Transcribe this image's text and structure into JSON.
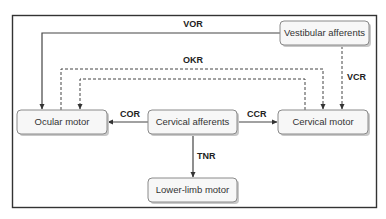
{
  "nodes": {
    "vestibular_afferents": "Vestibular afferents",
    "ocular_motor": "Ocular motor",
    "cervical_afferents": "Cervical afferents",
    "cervical_motor": "Cervical motor",
    "lower_limb_motor": "Lower-limb motor"
  },
  "edges": {
    "vor": {
      "label": "VOR",
      "from": "Vestibular afferents",
      "to": "Ocular motor",
      "style": "solid"
    },
    "okr": {
      "label": "OKR",
      "between": [
        "Ocular motor",
        "Cervical motor"
      ],
      "style": "dashed"
    },
    "vcr": {
      "label": "VCR",
      "from": "Vestibular afferents",
      "to": "Cervical motor",
      "style": "dashed"
    },
    "cor": {
      "label": "COR",
      "from": "Cervical afferents",
      "to": "Ocular motor",
      "style": "solid"
    },
    "ccr": {
      "label": "CCR",
      "from": "Cervical afferents",
      "to": "Cervical motor",
      "style": "solid"
    },
    "tnr": {
      "label": "TNR",
      "from": "Cervical afferents",
      "to": "Lower-limb motor",
      "style": "solid"
    }
  }
}
